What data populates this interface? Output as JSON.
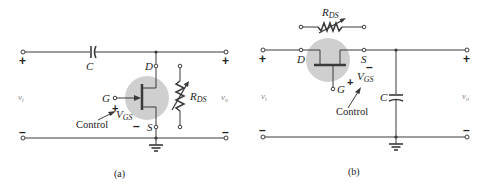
{
  "figure": {
    "panels": [
      {
        "id": "a",
        "caption": "(a)",
        "input_label": "v",
        "input_sub": "i",
        "output_label": "v",
        "output_sub": "o",
        "plus": "+",
        "minus": "–",
        "capacitor_label": "C",
        "drain_label": "D",
        "gate_label": "G",
        "source_label": "S",
        "resistor_label": "R",
        "resistor_sub": "DS",
        "control_label": "Control",
        "vgs_label": "V",
        "vgs_sub": "GS",
        "vgs_plus": "+",
        "vgs_minus": "–"
      },
      {
        "id": "b",
        "caption": "(b)",
        "input_label": "v",
        "input_sub": "i",
        "output_label": "v",
        "output_sub": "o",
        "plus": "+",
        "minus": "–",
        "capacitor_label": "C",
        "drain_label": "D",
        "gate_label": "G",
        "source_label": "S",
        "resistor_label": "R",
        "resistor_sub": "DS",
        "control_label": "Control",
        "vgs_label": "V",
        "vgs_sub": "GS",
        "vgs_plus": "+",
        "vgs_minus": "–"
      }
    ],
    "colors": {
      "wire": "#3a3a3a",
      "jfet_highlight": "#cfcfcf",
      "text": "#222222"
    }
  }
}
